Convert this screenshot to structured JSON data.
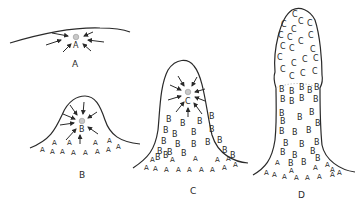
{
  "figure": {
    "panels": [
      {
        "id": "A",
        "label": "A",
        "center_cell": "A"
      },
      {
        "id": "B",
        "label": "B",
        "center_cell": "B",
        "cell_types": [
          "A",
          "B"
        ]
      },
      {
        "id": "C",
        "label": "C",
        "center_cell": "C",
        "cell_types": [
          "A",
          "B",
          "C"
        ]
      },
      {
        "id": "D",
        "label": "D",
        "cell_types": [
          "A",
          "B",
          "C"
        ]
      }
    ],
    "colors": {
      "ink": "#2a2a2a",
      "organizer_dot": "#c8c8c8",
      "background": "#ffffff"
    }
  }
}
